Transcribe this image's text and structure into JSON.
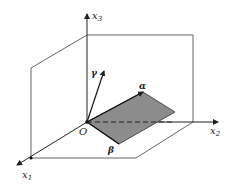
{
  "diagram": {
    "type": "3d-coordinate-system",
    "axes": [
      {
        "id": "x1",
        "label": "x",
        "sub": "1"
      },
      {
        "id": "x2",
        "label": "x",
        "sub": "2"
      },
      {
        "id": "x3",
        "label": "x",
        "sub": "3"
      }
    ],
    "origin_label": "O",
    "vectors": [
      {
        "id": "alpha",
        "label": "α"
      },
      {
        "id": "beta",
        "label": "β"
      },
      {
        "id": "gamma",
        "label": "γ"
      }
    ],
    "colors": {
      "lines": "#333333",
      "parallelogram_fill": "#8c8c8c",
      "background": "#ffffff"
    }
  }
}
